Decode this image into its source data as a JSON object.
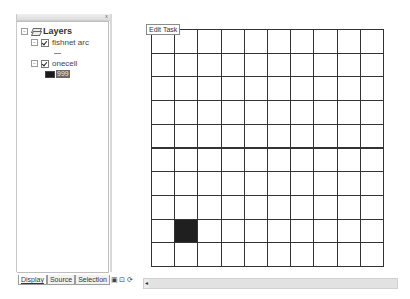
{
  "toc": {
    "root_label": "Layers",
    "layers": [
      {
        "name": "fishnet arc",
        "checked": true,
        "symbol": "line"
      },
      {
        "name": "onecell",
        "checked": true,
        "symbol": "fill",
        "legend_value": "999"
      }
    ],
    "tabs": [
      {
        "label": "Display",
        "active": true
      },
      {
        "label": "Source",
        "active": false
      },
      {
        "label": "Selection",
        "active": false
      }
    ],
    "close_glyph": "x"
  },
  "view_buttons": [
    "▣",
    "⊡",
    "⟳",
    "◂"
  ],
  "map": {
    "edit_task_label": "Edit Task",
    "grid": {
      "rows": 10,
      "cols": 10,
      "filled_cell": {
        "row": 8,
        "col": 1
      }
    },
    "colors": {
      "line": "#333333",
      "fill": "#1f1f1f"
    }
  },
  "scrollbar": {
    "left_arrow": "◂"
  }
}
